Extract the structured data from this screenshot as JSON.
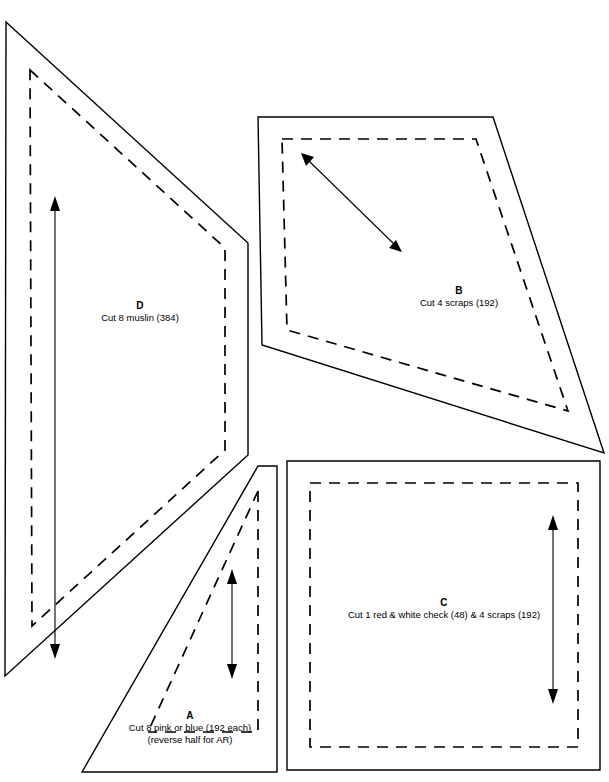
{
  "document": {
    "type": "quilt-pattern-template-sheet",
    "background_color": "#ffffff",
    "line_color": "#000000"
  },
  "pieces": [
    {
      "id": "A",
      "letter": "A",
      "description": "Cut 8 pink or blue (192 each)",
      "description_line2": "(reverse half for AR)",
      "shape": "right-triangle",
      "grain_arrow": "vertical-double-headed",
      "outline_points": "258,466 277,466 277,772 82,772",
      "seam_points": "258,491 258,732 148,732",
      "arrow": {
        "x": 232,
        "y1": 570,
        "y2": 678
      }
    },
    {
      "id": "B",
      "letter": "B",
      "description": "Cut 4 scraps (192)",
      "shape": "quadrilateral",
      "grain_arrow": "diagonal-double-headed",
      "outline_points": "258,117 493,117 604,453 262,345",
      "seam_points": "282,139 476,139 568,411 287,330",
      "arrow": {
        "x1": 303,
        "y1": 155,
        "x2": 400,
        "y2": 250
      }
    },
    {
      "id": "C",
      "letter": "C",
      "description": "Cut 1 red & white check (48) & 4 scraps (192)",
      "shape": "square",
      "grain_arrow": "vertical-double-headed",
      "outline_points": "287,461 600,461 600,770 287,770",
      "seam_points": "310,483 578,483 578,747 310,747",
      "arrow": {
        "x": 553,
        "y1": 516,
        "y2": 703
      }
    },
    {
      "id": "D",
      "letter": "D",
      "description": "Cut 8 muslin (384)",
      "shape": "quadrilateral",
      "grain_arrow": "vertical-double-headed",
      "outline_points": "6,22 248,243 248,455 5,676",
      "seam_points": "30,70 225,248 225,450 32,626",
      "arrow": {
        "x": 55,
        "y1": 197,
        "y2": 658
      }
    }
  ],
  "labels": {
    "a_letter": "A",
    "a_line1": "Cut 8 pink or blue (192 each)",
    "a_line2": "(reverse half for AR)",
    "b_letter": "B",
    "b_line1": "Cut 4 scraps (192)",
    "c_letter": "C",
    "c_line1": "Cut 1 red & white check (48) & 4 scraps (192)",
    "d_letter": "D",
    "d_line1": "Cut 8 muslin (384)"
  }
}
